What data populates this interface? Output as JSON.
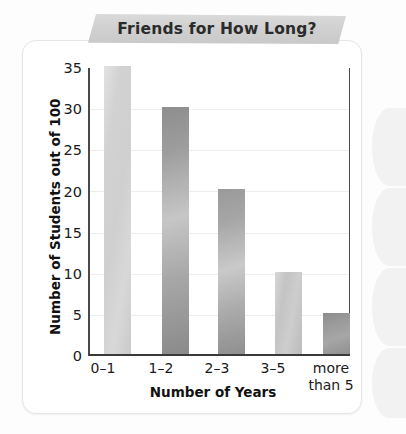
{
  "chart_data": {
    "type": "bar",
    "title": "Friends for How Long?",
    "xlabel": "Number of Years",
    "ylabel": "Number of Students out of 100",
    "categories": [
      "0–1",
      "1–2",
      "2–3",
      "3–5",
      "more than 5"
    ],
    "category_lines": [
      [
        "0–1"
      ],
      [
        "1–2"
      ],
      [
        "2–3"
      ],
      [
        "3–5"
      ],
      [
        "more",
        "than 5"
      ]
    ],
    "values": [
      35,
      30,
      20,
      10,
      5
    ],
    "ylim": [
      0,
      35
    ],
    "yticks": [
      0,
      5,
      10,
      15,
      20,
      25,
      30,
      35
    ],
    "ytick_labels": [
      "0",
      "5",
      "10",
      "15",
      "20",
      "25",
      "30",
      "35"
    ],
    "grid": true,
    "legend": "none",
    "bar_styles": [
      "light",
      "dark",
      "mid",
      "lightmid",
      "darkshort"
    ],
    "colors": {
      "banner": "#cfcfcf",
      "axis": "#3a3a3a",
      "gridline": "#ededed",
      "bar_light": "#d2d2d2",
      "bar_dark": "#9a9a9a",
      "card": "#ffffff",
      "page": "#fdfdfd",
      "text": "#1a1a1a"
    }
  }
}
